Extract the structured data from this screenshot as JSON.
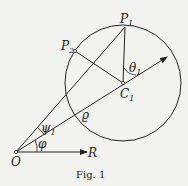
{
  "figure": {
    "caption": "Fig. 1",
    "labels": {
      "P1": "P",
      "P1_sub": "1",
      "P2": "P",
      "P2_sub": "2",
      "C1": "C",
      "C1_sub": "1",
      "theta1": "θ",
      "theta1_sub": "1",
      "psi1": "ψ",
      "psi1_sub": "1",
      "rho": "ϱ",
      "phi": "φ",
      "O": "O",
      "R": "R"
    },
    "colors": {
      "ink": "#222222",
      "paper": "#f2f2ee"
    }
  }
}
